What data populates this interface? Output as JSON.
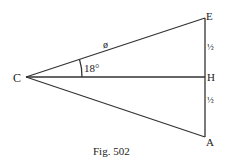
{
  "figure": {
    "caption": "Fig. 502",
    "points": {
      "C": {
        "label": "C",
        "x": 26,
        "y": 77
      },
      "E": {
        "label": "E",
        "x": 205,
        "y": 18
      },
      "H": {
        "label": "H",
        "x": 205,
        "y": 77
      },
      "A": {
        "label": "A",
        "x": 205,
        "y": 137
      }
    },
    "segments": [
      {
        "from": "C",
        "to": "E"
      },
      {
        "from": "C",
        "to": "H"
      },
      {
        "from": "C",
        "to": "A"
      },
      {
        "from": "E",
        "to": "A"
      }
    ],
    "annotations": {
      "side_CE": "ø",
      "angle_ECH": "18°",
      "segment_EH": "½",
      "segment_HA": "½"
    },
    "colors": {
      "line": "#333333",
      "text": "#222222",
      "background": "#ffffff"
    }
  }
}
